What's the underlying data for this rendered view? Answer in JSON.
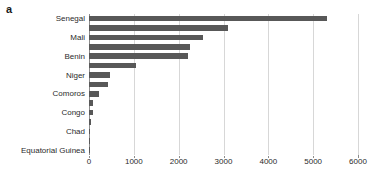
{
  "panel": {
    "label": "a"
  },
  "chart_data": {
    "type": "bar",
    "orientation": "horizontal",
    "title": "",
    "xlabel": "",
    "ylabel": "",
    "xlim": [
      0,
      6000
    ],
    "xticks": [
      0,
      1000,
      2000,
      3000,
      4000,
      5000,
      6000
    ],
    "xtick_labels": [
      "0",
      "1000",
      "2000",
      "3000",
      "4000",
      "5000",
      "6000"
    ],
    "grid": true,
    "grid_axis": "x",
    "legend": false,
    "bar_color": "#585858",
    "grid_color": "#d7d7d7",
    "axis_color": "#8c8c8c",
    "visible_category_labels": [
      "Senegal",
      "Mali",
      "Benin",
      "Niger",
      "Comoros",
      "Congo",
      "Chad",
      "Equatorial Guinea"
    ],
    "categories": [
      "Senegal",
      "",
      "Mali",
      "",
      "Benin",
      "",
      "Niger",
      "",
      "Comoros",
      "",
      "Congo",
      "",
      "Chad",
      "",
      "Equatorial Guinea"
    ],
    "values": [
      5300,
      3100,
      2550,
      2250,
      2200,
      1050,
      470,
      420,
      230,
      95,
      90,
      40,
      12,
      8,
      3
    ]
  }
}
